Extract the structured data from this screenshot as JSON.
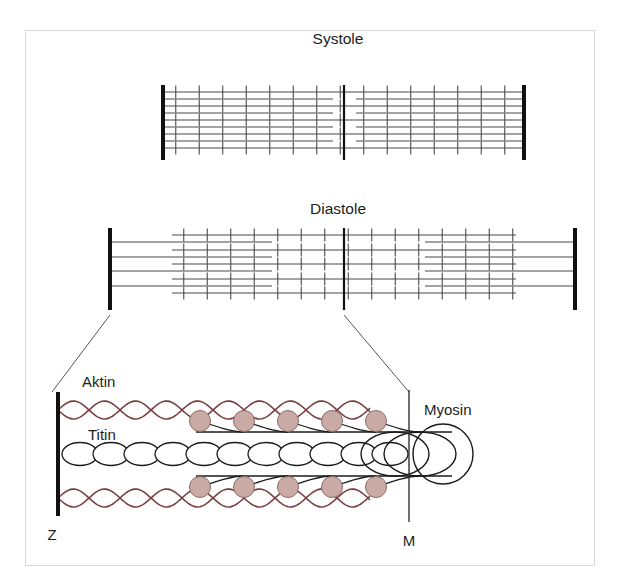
{
  "figure": {
    "kind": "sarcomere-diagram",
    "frame": {
      "stroke": "#d8d8d8",
      "fill": "#ffffff"
    },
    "panels": [
      {
        "id": "systole",
        "title": "Systole",
        "title_x": 338,
        "title_y": 44,
        "z_line_left_x": 163,
        "z_line_right_x": 524,
        "m_line_x": 344,
        "band_top": 85,
        "band_bottom": 160,
        "actin_rows_y": [
          92,
          106,
          120,
          134,
          148
        ],
        "thin_rows_y": [
          99,
          113,
          127,
          141
        ],
        "left_thin_end_x": 333,
        "right_thin_start_x": 356,
        "cross_bridge_spacing": 23.5,
        "z_line_color": "#111111",
        "filament_color": "#4a4a4a"
      },
      {
        "id": "diastole",
        "title": "Diastole",
        "title_x": 338,
        "title_y": 214,
        "z_line_left_x": 110,
        "z_line_right_x": 575,
        "m_line_x": 344,
        "band_top": 228,
        "band_bottom": 310,
        "actin_rows_y": [
          235,
          250,
          264,
          279,
          293
        ],
        "thin_rows_y": [
          242,
          257,
          271,
          286
        ],
        "left_thin_end_x": 272,
        "right_thin_start_x": 425,
        "cross_bridge_spacing": 23.5,
        "z_line_color": "#111111",
        "filament_color": "#4a4a4a"
      }
    ],
    "leader_lines": [
      {
        "name": "leader-left",
        "x1": 110,
        "y1": 315,
        "x2": 52,
        "y2": 392
      },
      {
        "name": "leader-right",
        "x1": 344,
        "y1": 315,
        "x2": 409,
        "y2": 392
      }
    ],
    "detail": {
      "z_line_x": 58,
      "z_line_top": 392,
      "z_line_bottom": 516,
      "m_line_x": 409,
      "m_line_top": 390,
      "m_line_bottom": 522,
      "axis_y": 454,
      "actin_color": "#7a3f42",
      "titin_color": "#1a1a1a",
      "head_fill": "#c9aaa4",
      "head_stroke": "#8c6d66",
      "actin_top_y": 410,
      "actin_bottom_y": 498,
      "actin_amplitude": 9,
      "actin_period": 62,
      "actin_x_start": 58,
      "actin_x_end": 370,
      "titin_bead_count": 11,
      "myosin_head_count": 5,
      "labels": [
        {
          "name": "label-aktin",
          "text": "Aktin",
          "x": 82,
          "y": 387
        },
        {
          "name": "label-titin",
          "text": "Titin",
          "x": 88,
          "y": 440
        },
        {
          "name": "label-myosin",
          "text": "Myosin",
          "x": 424,
          "y": 415
        },
        {
          "name": "label-z",
          "text": "Z",
          "x": 52,
          "y": 540
        },
        {
          "name": "label-m",
          "text": "M",
          "x": 404,
          "y": 546
        }
      ]
    },
    "colors": {
      "actin_line": "#7a3f42",
      "myosin_head_fill": "#c9aaa4",
      "myosin_head_stroke": "#8c6d66",
      "filament": "#4a4a4a",
      "z_band": "#111111",
      "text": "#1d1d1d",
      "frame_border": "#d8d8d8",
      "background": "#ffffff"
    }
  }
}
